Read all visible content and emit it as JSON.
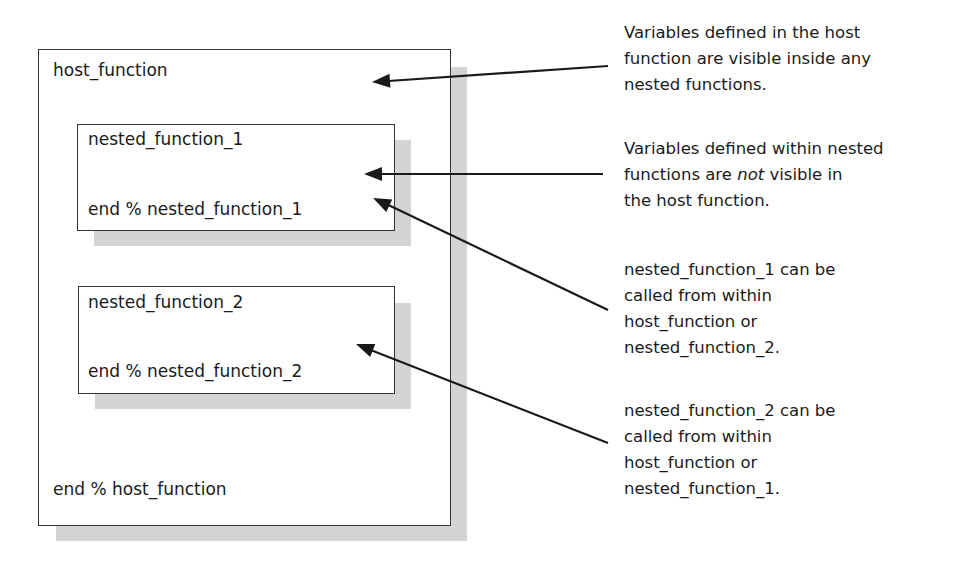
{
  "diagram": {
    "host": {
      "start_label": "host_function",
      "end_label": "end % host_function"
    },
    "nested": [
      {
        "start_label": "nested_function_1",
        "end_label": "end % nested_function_1"
      },
      {
        "start_label": "nested_function_2",
        "end_label": "end % nested_function_2"
      }
    ],
    "annotations": [
      {
        "lines": [
          "Variables defined in the host",
          "function are visible inside any",
          "nested functions."
        ],
        "points_to": "host_function"
      },
      {
        "line1": "Variables defined within nested",
        "line2_pre": "functions are ",
        "line2_em": "not",
        "line2_post": " visible in",
        "line3": "the host function.",
        "points_to": "nested_function_1"
      },
      {
        "lines": [
          "nested_function_1 can be",
          "called from within",
          "host_function or",
          "nested_function_2."
        ],
        "points_to": "nested_function_1"
      },
      {
        "lines": [
          "nested_function_2 can be",
          "called from within",
          "host_function or",
          "nested_function_1."
        ],
        "points_to": "nested_function_2"
      }
    ],
    "colors": {
      "border": "#333333",
      "shadow": "#d4d4d4",
      "arrow": "#1a1a1a",
      "text": "#1a1a1a"
    }
  }
}
